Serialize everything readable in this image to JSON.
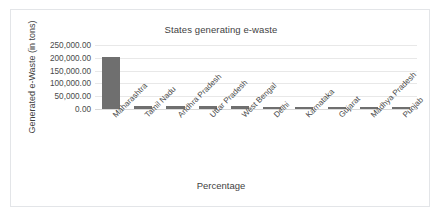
{
  "chart_data": {
    "type": "bar",
    "title": "States generating e-waste",
    "xlabel": "Percentage",
    "ylabel": "Generated e-Waste (in tons)",
    "categories": [
      "Maharashtra",
      "Tamil Nadu",
      "Andhra Pradesh",
      "Uttar Pradesh",
      "West Bengal",
      "Delhi",
      "Karnataka",
      "Gujarat",
      "Madhya Pradesh",
      "Punjab"
    ],
    "values": [
      202000.0,
      13000.0,
      12800.0,
      10700.0,
      10500.0,
      9700.0,
      9200.0,
      8900.0,
      7800.0,
      6900.0
    ],
    "ylim": [
      0,
      250000
    ],
    "ytick_values": [
      0,
      50000,
      100000,
      150000,
      200000,
      250000
    ],
    "ytick_labels": [
      "0.00",
      "50,000.00",
      "100,000.00",
      "150,000.00",
      "200,000.00",
      "250,000.00"
    ],
    "grid": true,
    "legend": false,
    "bar_color": "#6f6f6f",
    "gridline_color": "#e8e8e8",
    "plot_background": "#ffffff",
    "border_color": "#e3e5e8",
    "xtick_rotation": -45
  }
}
